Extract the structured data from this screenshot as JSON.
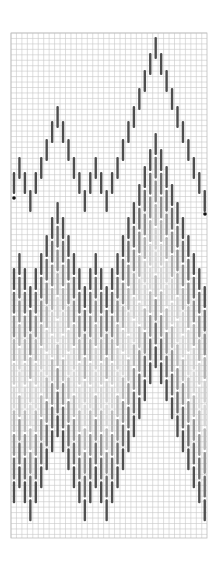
{
  "pattern": {
    "type": "bargello-stitch-chart",
    "grid": {
      "left": 11,
      "top": 33,
      "right": 207,
      "bottom": 538,
      "cell": 5.45,
      "line_color": "#c8c8c8"
    },
    "stitch": {
      "first_x": 14,
      "column_step": 5.45,
      "length": 22,
      "width": 2.4
    },
    "outline": {
      "color": "#4d4d4d",
      "tops": [
        172,
        157,
        172,
        190,
        172,
        157,
        139,
        121,
        106,
        121,
        139,
        157,
        172,
        190,
        172,
        157,
        172,
        190,
        172,
        157,
        139,
        121,
        106,
        88,
        70,
        53,
        37,
        53,
        70,
        88,
        106,
        121,
        139,
        157,
        172,
        190
      ]
    },
    "fill_band": {
      "offset_from_outline": 96,
      "row_pitch": 23.7,
      "row_colors": [
        "#505050",
        "#6e6e6e",
        "#8e8e8e",
        "#b0b0b0",
        "#cdcdcd",
        "#d4d4d4",
        "#b8b8b8",
        "#949494",
        "#6e6e6e",
        "#4f4f4f"
      ]
    },
    "markers": [
      {
        "name": "start-marker",
        "x": 14,
        "y": 198,
        "color": "#111111"
      },
      {
        "name": "end-marker",
        "x": 205,
        "y": 214,
        "color": "#111111"
      }
    ]
  }
}
